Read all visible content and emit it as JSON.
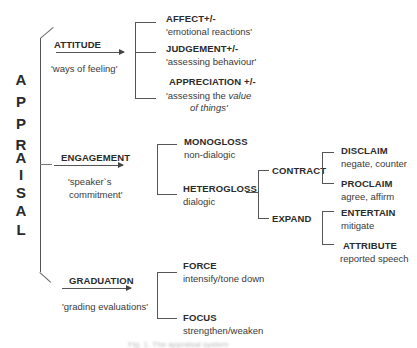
{
  "root": {
    "label": "APPRAISAL",
    "letters": [
      "A",
      "P",
      "P",
      "R",
      "A",
      "I",
      "S",
      "A",
      "L"
    ]
  },
  "attitude": {
    "label": "ATTITUDE",
    "gloss": "'ways of feeling'",
    "children": [
      {
        "label": "AFFECT+/-",
        "gloss": "'emotional reactions'"
      },
      {
        "label": "JUDGEMENT+/-",
        "gloss": "'assessing behaviour'"
      },
      {
        "label": "APPRECIATION +/-",
        "gloss_pre": "'assessing the ",
        "gloss_italic": "value",
        "gloss_line2": "of things'"
      }
    ]
  },
  "engagement": {
    "label": "ENGAGEMENT",
    "gloss_line1": "'speaker`s",
    "gloss_line2": "commitment'",
    "monogloss": {
      "label": "MONOGLOSS",
      "gloss": "non-dialogic"
    },
    "heterogloss": {
      "label": "HETEROGLOSS",
      "gloss": "dialogic"
    },
    "contract": {
      "label": "CONTRACT",
      "children": [
        {
          "label": "DISCLAIM",
          "gloss": "negate, counter"
        },
        {
          "label": "PROCLAIM",
          "gloss": "agree, affirm"
        }
      ]
    },
    "expand": {
      "label": "EXPAND",
      "children": [
        {
          "label": "ENTERTAIN",
          "gloss": "mitigate"
        },
        {
          "label": "ATTRIBUTE",
          "gloss": "reported speech"
        }
      ]
    }
  },
  "graduation": {
    "label": "GRADUATION",
    "gloss": "'grading evaluations'",
    "children": [
      {
        "label": "FORCE",
        "gloss": "intensify/tone down"
      },
      {
        "label": "FOCUS",
        "gloss": "strengthen/weaken"
      }
    ]
  },
  "caption": {
    "text": "Fig. 1. The appraisal system"
  }
}
